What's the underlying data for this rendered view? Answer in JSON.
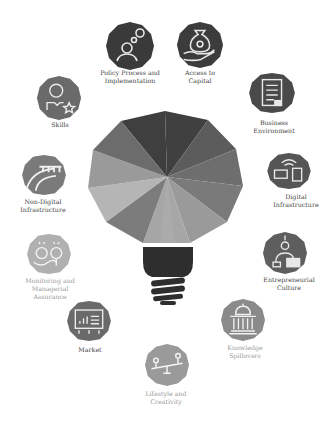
{
  "diagram": {
    "center": {
      "name": "lightbulb",
      "segment_colors": [
        "#3f3f3f",
        "#5c5c5c",
        "#6d6d6d",
        "#7f7f7f",
        "#8d8d8d",
        "#9c9c9c",
        "#a3a3a3",
        "#8a8a8a",
        "#b3b3b3",
        "#9a9a9a",
        "#7a7a7a"
      ],
      "base_color": "#2e2e2e"
    },
    "nodes": [
      {
        "id": "policy",
        "label_line1": "Policy Process and",
        "label_line2": "Implementation",
        "icon": "person-gear-icon",
        "color": "#3a3a3a"
      },
      {
        "id": "capital",
        "label_line1": "Access to",
        "label_line2": "Capital",
        "icon": "money-bag-hand-icon",
        "color": "#3c3c3c"
      },
      {
        "id": "business",
        "label_line1": "Business",
        "label_line2": "Environment",
        "icon": "clipboard-icon",
        "color": "#4a4a4a"
      },
      {
        "id": "digital",
        "label_line1": "Digital",
        "label_line2": "Infrastructure",
        "icon": "wifi-devices-icon",
        "color": "#555555"
      },
      {
        "id": "entrepreneurial",
        "label_line1": "Entrepreneurial",
        "label_line2": "Culture",
        "icon": "person-laptop-icon",
        "color": "#5e5e5e"
      },
      {
        "id": "knowledge",
        "label_line1": "Knowledge",
        "label_line2": "Spillovers",
        "icon": "capitol-building-icon",
        "color": "#8a8a8a"
      },
      {
        "id": "lifestyle",
        "label_line1": "Lifestyle and",
        "label_line2": "Creativity",
        "icon": "seesaw-icon",
        "color": "#9a9a9a"
      },
      {
        "id": "market",
        "label_line1": "Market",
        "label_line2": "",
        "icon": "presentation-chart-icon",
        "color": "#6a6a6a"
      },
      {
        "id": "monitoring",
        "label_line1": "Monitoring and",
        "label_line2": "Managerial",
        "label_line3": "Assurance",
        "icon": "magnifier-faces-icon",
        "color": "#b0b0b0"
      },
      {
        "id": "nondigital",
        "label_line1": "Non-Digital",
        "label_line2": "Infrastructure",
        "icon": "road-bridge-icon",
        "color": "#7a7a7a"
      },
      {
        "id": "skills",
        "label_line1": "Skills",
        "label_line2": "",
        "icon": "person-star-icon",
        "color": "#6a6a6a"
      }
    ]
  }
}
